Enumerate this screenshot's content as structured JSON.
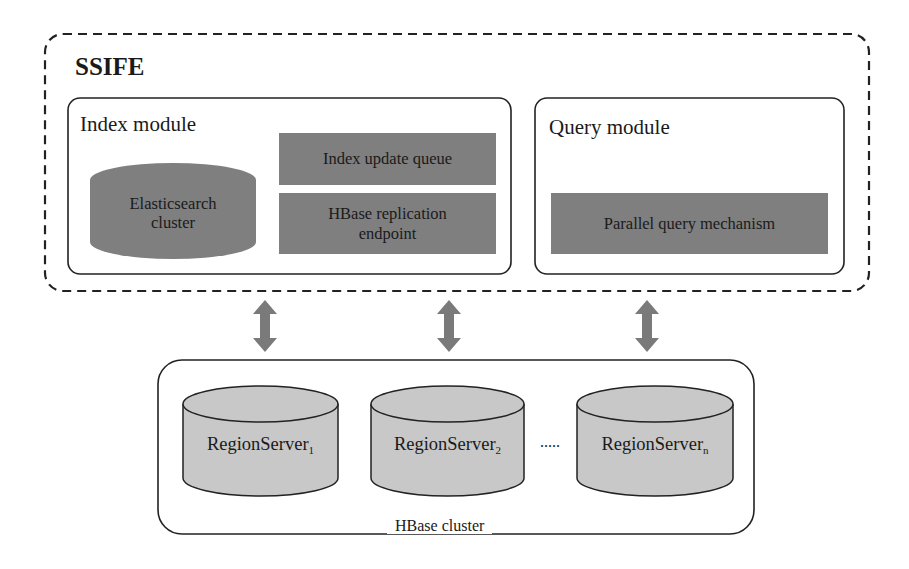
{
  "system": {
    "title": "SSIFE",
    "index_module": {
      "label": "Index module",
      "elasticsearch": {
        "line1": "Elasticsearch",
        "line2": "cluster"
      },
      "index_update_queue": "Index update queue",
      "hbase_replication": {
        "line1": "HBase replication",
        "line2": "endpoint"
      }
    },
    "query_module": {
      "label": "Query module",
      "parallel_query": "Parallel query mechanism"
    }
  },
  "hbase_cluster": {
    "label": "HBase cluster",
    "region_servers": [
      {
        "name": "RegionServer",
        "subscript": "1"
      },
      {
        "name": "RegionServer",
        "subscript": "2"
      },
      {
        "name": "RegionServer",
        "subscript": "n"
      }
    ],
    "ellipsis": "....."
  },
  "colors": {
    "dark_box_fill": "#7f7f7f",
    "cylinder_fill": "#c8c8c8",
    "arrow_fill": "#7a7a7a",
    "stroke": "#222222"
  }
}
